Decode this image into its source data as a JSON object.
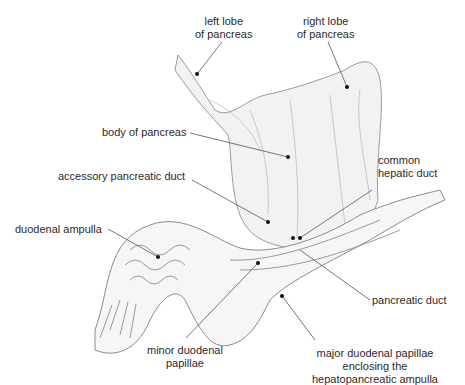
{
  "diagram": {
    "labels": [
      {
        "id": "left-lobe",
        "lines": [
          "left lobe",
          "of pancreas"
        ]
      },
      {
        "id": "right-lobe",
        "lines": [
          "right lobe",
          "of pancreas"
        ]
      },
      {
        "id": "body",
        "lines": [
          "body of pancreas"
        ]
      },
      {
        "id": "accessory-duct",
        "lines": [
          "accessory pancreatic duct"
        ]
      },
      {
        "id": "common-hepatic-duct",
        "lines": [
          "common",
          "hepatic duct"
        ]
      },
      {
        "id": "duodenal-ampulla",
        "lines": [
          "duodenal ampulla"
        ]
      },
      {
        "id": "pancreatic-duct",
        "lines": [
          "pancreatic duct"
        ]
      },
      {
        "id": "minor-papillae",
        "lines": [
          "minor duodenal",
          "papillae"
        ]
      },
      {
        "id": "major-papillae",
        "lines": [
          "major duodenal papillae",
          "enclosing the",
          "hepatopancreatic ampulla"
        ]
      }
    ],
    "colors": {
      "line": "#555555",
      "dot": "#111111",
      "tissue": "#9a9a9a",
      "shade": "#c8c8c8"
    }
  }
}
